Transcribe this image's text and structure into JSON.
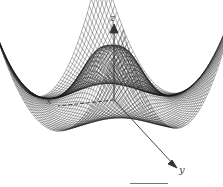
{
  "figure": {
    "type": "3d-wireframe-surface",
    "axes": {
      "x_label": "x",
      "y_label": "y",
      "z_label": "z"
    },
    "colors": {
      "mesh": "#1a1a1a",
      "background": "#ffffff",
      "axis": "#333333"
    }
  }
}
